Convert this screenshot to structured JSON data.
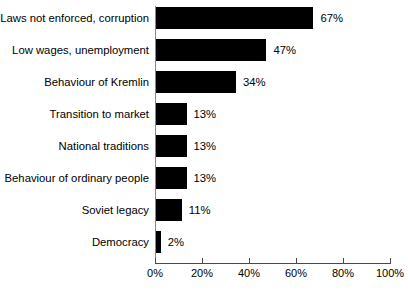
{
  "chart_data": {
    "type": "bar",
    "orientation": "horizontal",
    "title": "",
    "subtitle": "",
    "xlabel": "",
    "ylabel": "",
    "xlim": [
      0,
      100
    ],
    "grid": false,
    "legend": null,
    "bar_color": "#000000",
    "background_color": "#ffffff",
    "axis_color": "#4a4a4a",
    "xticks": [
      0,
      20,
      40,
      60,
      80,
      100
    ],
    "xtick_labels": [
      "0%",
      "20%",
      "40%",
      "60%",
      "80%",
      "100%"
    ],
    "categories": [
      "Laws not enforced, corruption",
      "Low wages, unemployment",
      "Behaviour of Kremlin",
      "Transition to market",
      "National traditions",
      "Behaviour of ordinary people",
      "Soviet legacy",
      "Democracy"
    ],
    "values": [
      67,
      47,
      34,
      13,
      13,
      13,
      11,
      2
    ],
    "data_labels": [
      "67%",
      "47%",
      "34%",
      "13%",
      "13%",
      "13%",
      "11%",
      "2%"
    ]
  }
}
